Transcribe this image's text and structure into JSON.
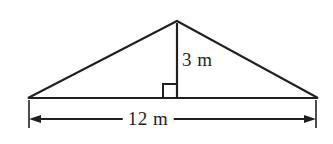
{
  "figure": {
    "type": "geometry-diagram",
    "shape": "triangle",
    "stroke_color": "#231f20",
    "background_color": "#ffffff",
    "labels": {
      "height": "3 m",
      "base": "12 m"
    },
    "measurements": {
      "height_value": 3,
      "height_unit": "m",
      "base_value": 12,
      "base_unit": "m"
    },
    "markers": {
      "right_angle": "right-angle-square",
      "base_dimension": "double-headed-arrow"
    },
    "geometry": {
      "apex": [
        177,
        21
      ],
      "base_left": [
        28,
        98
      ],
      "base_right": [
        318,
        98
      ],
      "foot_of_height": [
        177,
        98
      ],
      "dimension_line_y": 119,
      "extension_left_x": 29,
      "extension_right_x": 316
    }
  }
}
